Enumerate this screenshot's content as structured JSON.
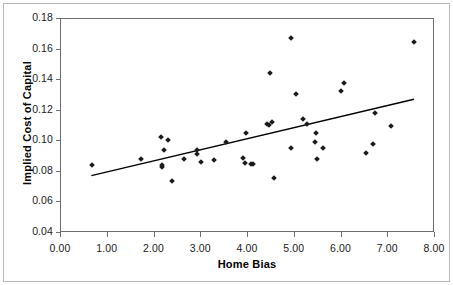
{
  "chart_data": {
    "type": "scatter",
    "title": "",
    "xlabel": "Home Bias",
    "ylabel": "Implied Cost of Capital",
    "xlim": [
      0.0,
      8.0
    ],
    "ylim": [
      0.04,
      0.18
    ],
    "xticks": [
      "0.00",
      "1.00",
      "2.00",
      "3.00",
      "4.00",
      "5.00",
      "6.00",
      "7.00",
      "8.00"
    ],
    "xtick_values": [
      0.0,
      1.0,
      2.0,
      3.0,
      4.0,
      5.0,
      6.0,
      7.0,
      8.0
    ],
    "yticks": [
      "0.04",
      "0.06",
      "0.08",
      "0.10",
      "0.12",
      "0.14",
      "0.16",
      "0.18"
    ],
    "ytick_values": [
      0.04,
      0.06,
      0.08,
      0.1,
      0.12,
      0.14,
      0.16,
      0.18
    ],
    "grid": false,
    "legend": null,
    "marker": "diamond",
    "marker_color": "#1b1b1b",
    "points": [
      {
        "x": 0.66,
        "y": 0.0842
      },
      {
        "x": 1.72,
        "y": 0.0885
      },
      {
        "x": 2.14,
        "y": 0.1028
      },
      {
        "x": 2.16,
        "y": 0.0845
      },
      {
        "x": 2.16,
        "y": 0.0832
      },
      {
        "x": 2.2,
        "y": 0.0945
      },
      {
        "x": 2.28,
        "y": 0.1008
      },
      {
        "x": 2.37,
        "y": 0.0737
      },
      {
        "x": 2.64,
        "y": 0.0884
      },
      {
        "x": 2.9,
        "y": 0.0943
      },
      {
        "x": 2.91,
        "y": 0.0915
      },
      {
        "x": 3.0,
        "y": 0.0865
      },
      {
        "x": 3.28,
        "y": 0.0876
      },
      {
        "x": 3.52,
        "y": 0.0995
      },
      {
        "x": 3.9,
        "y": 0.0893
      },
      {
        "x": 3.93,
        "y": 0.0858
      },
      {
        "x": 3.96,
        "y": 0.1054
      },
      {
        "x": 4.06,
        "y": 0.0851
      },
      {
        "x": 4.1,
        "y": 0.085
      },
      {
        "x": 4.41,
        "y": 0.111
      },
      {
        "x": 4.44,
        "y": 0.1107
      },
      {
        "x": 4.48,
        "y": 0.1444
      },
      {
        "x": 4.52,
        "y": 0.1123
      },
      {
        "x": 4.55,
        "y": 0.0763
      },
      {
        "x": 4.92,
        "y": 0.1675
      },
      {
        "x": 4.93,
        "y": 0.0955
      },
      {
        "x": 5.03,
        "y": 0.1308
      },
      {
        "x": 5.17,
        "y": 0.1148
      },
      {
        "x": 5.27,
        "y": 0.1115
      },
      {
        "x": 5.43,
        "y": 0.0997
      },
      {
        "x": 5.46,
        "y": 0.1053
      },
      {
        "x": 5.47,
        "y": 0.0887
      },
      {
        "x": 5.6,
        "y": 0.0955
      },
      {
        "x": 5.99,
        "y": 0.1328
      },
      {
        "x": 6.06,
        "y": 0.1379
      },
      {
        "x": 6.52,
        "y": 0.0922
      },
      {
        "x": 6.68,
        "y": 0.098
      },
      {
        "x": 6.71,
        "y": 0.1186
      },
      {
        "x": 7.06,
        "y": 0.11
      },
      {
        "x": 7.55,
        "y": 0.1647
      }
    ],
    "trendline": {
      "type": "linear",
      "x_start": 0.65,
      "y_start": 0.0775,
      "x_end": 7.55,
      "y_end": 0.1275,
      "color": "#000000"
    }
  }
}
